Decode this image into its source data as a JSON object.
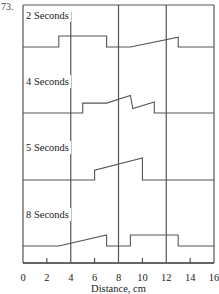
{
  "figure_number": "73.",
  "chart_data": {
    "type": "line",
    "title": "",
    "xlabel": "Distance, cm",
    "ylabel": "",
    "xlim": [
      0,
      16
    ],
    "x_ticks": [
      0,
      2,
      4,
      6,
      8,
      10,
      12,
      14,
      16
    ],
    "x_tick_labels": [
      "0",
      "2",
      "4",
      "6",
      "8",
      "10",
      "12",
      "14",
      "16"
    ],
    "grid_x": [
      4,
      8,
      12
    ],
    "panels": [
      {
        "label": "2 Seconds",
        "points": [
          [
            0,
            0
          ],
          [
            3,
            0
          ],
          [
            3,
            1
          ],
          [
            7,
            1
          ],
          [
            7,
            0
          ],
          [
            9,
            0
          ],
          [
            13,
            0.9
          ],
          [
            13,
            0
          ],
          [
            16,
            0
          ]
        ]
      },
      {
        "label": "4 Seconds",
        "points": [
          [
            0,
            0
          ],
          [
            5,
            0
          ],
          [
            5,
            0.9
          ],
          [
            7,
            0.9
          ],
          [
            9,
            1.6
          ],
          [
            9.2,
            0.4
          ],
          [
            11,
            1.0
          ],
          [
            11,
            0
          ],
          [
            16,
            0
          ]
        ]
      },
      {
        "label": "5 Seconds",
        "points": [
          [
            0,
            0
          ],
          [
            6,
            0
          ],
          [
            6,
            0.9
          ],
          [
            10,
            2.0
          ],
          [
            10,
            0
          ],
          [
            16,
            0
          ]
        ]
      },
      {
        "label": "8 Seconds",
        "points": [
          [
            0,
            0
          ],
          [
            3,
            0
          ],
          [
            7,
            1.0
          ],
          [
            7,
            0
          ],
          [
            9,
            0
          ],
          [
            9,
            1.0
          ],
          [
            13,
            1.0
          ],
          [
            13,
            0
          ],
          [
            16,
            0
          ]
        ]
      }
    ],
    "legend": "none"
  }
}
